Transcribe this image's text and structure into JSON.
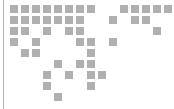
{
  "logo": {
    "name": "dotted-world-map-logo",
    "alt_text": "Dotted world map",
    "canvas": {
      "width": 174,
      "height": 109,
      "background": "#ffffff"
    },
    "colors": {
      "dot": "#b0b0b0",
      "rule": "#b4b4b4",
      "background": "#ffffff"
    },
    "grid": {
      "origin_x": 10,
      "origin_y": 5,
      "pitch_x": 11,
      "pitch_y": 11,
      "dot_width": 8,
      "dot_height": 8,
      "columns": 15,
      "rows": 9
    },
    "rule": {
      "x": 3,
      "y": 0,
      "width": 1,
      "height": 109
    },
    "dot_rows": [
      {
        "row": 0,
        "cols": [
          0,
          1,
          2,
          3,
          4,
          5,
          6,
          7,
          10,
          11,
          12,
          13,
          14
        ]
      },
      {
        "row": 1,
        "cols": [
          0,
          1,
          2,
          3,
          4,
          5,
          6,
          9,
          11,
          12
        ]
      },
      {
        "row": 2,
        "cols": [
          0,
          1,
          3,
          5,
          6,
          13
        ]
      },
      {
        "row": 3,
        "cols": [
          0,
          2,
          6,
          7,
          9
        ]
      },
      {
        "row": 4,
        "cols": [
          1,
          2,
          7
        ]
      },
      {
        "row": 5,
        "cols": [
          4,
          6,
          7
        ]
      },
      {
        "row": 6,
        "cols": [
          3,
          5,
          7,
          8
        ]
      },
      {
        "row": 7,
        "cols": [
          3,
          7
        ]
      },
      {
        "row": 8,
        "cols": [
          4
        ]
      }
    ],
    "dot_count": 46
  }
}
